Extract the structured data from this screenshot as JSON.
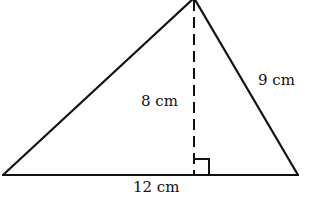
{
  "diagram": {
    "type": "triangle",
    "labels": {
      "height": "8 cm",
      "side": "9 cm",
      "base": "12 cm"
    },
    "marks": {
      "right_angle": "right-angle-marker",
      "altitude": "dashed-altitude"
    },
    "colors": {
      "stroke": "#111111",
      "background": "#ffffff"
    }
  }
}
